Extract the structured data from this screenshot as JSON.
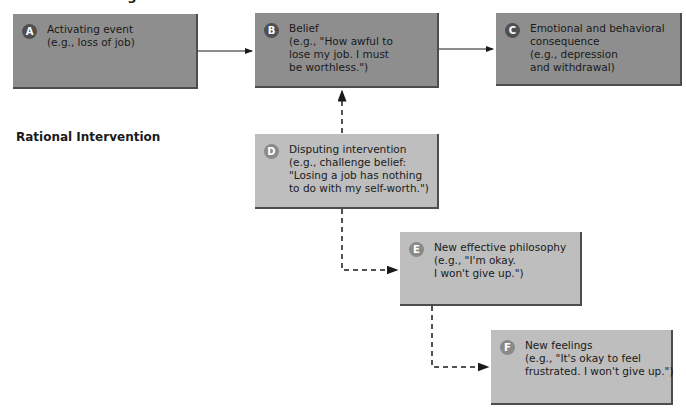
{
  "header": {
    "title_partial": "Irrational Thinking"
  },
  "sections": {
    "rational_intervention": "Rational Intervention"
  },
  "boxes": {
    "A": {
      "letter": "A",
      "lines": [
        "Activating event",
        "(e.g., loss of job)"
      ]
    },
    "B": {
      "letter": "B",
      "lines": [
        "Belief",
        "(e.g., \"How awful to",
        "lose my job. I must",
        "be worthless.\")"
      ]
    },
    "C": {
      "letter": "C",
      "lines": [
        "Emotional and behavioral",
        "consequence",
        "(e.g., depression",
        "and withdrawal)"
      ]
    },
    "D": {
      "letter": "D",
      "lines": [
        "Disputing intervention",
        "(e.g., challenge belief:",
        "\"Losing a job has nothing",
        "to do with my self-worth.\")"
      ]
    },
    "E": {
      "letter": "E",
      "lines": [
        "New effective philosophy",
        "(e.g., \"I'm okay.",
        "I won't give up.\")"
      ]
    },
    "F": {
      "letter": "F",
      "lines": [
        "New feelings",
        "(e.g., \"It's okay to feel",
        "frustrated. I won't give up.\")"
      ]
    }
  },
  "colors": {
    "dark_box": "#8e8e8e",
    "light_box": "#bebebe",
    "dark_badge": "#4f4f4f",
    "light_badge": "#8a8a8a",
    "arrow": "#1a1a1a"
  }
}
